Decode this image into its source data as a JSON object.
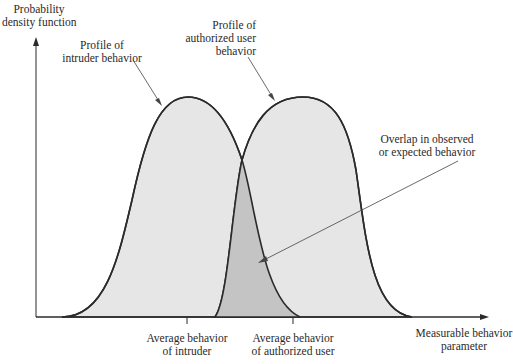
{
  "y_axis": {
    "label_line1": "Probability",
    "label_line2": "density function"
  },
  "x_axis": {
    "label_line1": "Measurable behavior",
    "label_line2": "parameter"
  },
  "curves": {
    "intruder": {
      "label_line1": "Profile of",
      "label_line2": "intruder behavior",
      "fill": "#e6e6e6"
    },
    "authorized": {
      "label_line1": "Profile of",
      "label_line2": "authorized user",
      "label_line3": "behavior",
      "fill": "#e6e6e6"
    }
  },
  "overlap": {
    "label_line1": "Overlap in observed",
    "label_line2": "or expected behavior",
    "fill": "#c4c4c4"
  },
  "ticks": {
    "intruder_avg": {
      "label_line1": "Average behavior",
      "label_line2": "of intruder"
    },
    "authorized_avg": {
      "label_line1": "Average behavior",
      "label_line2": "of authorized user"
    }
  },
  "colors": {
    "stroke": "#2b2b2b",
    "light_fill": "#e6e6e6",
    "dark_fill": "#c4c4c4"
  }
}
